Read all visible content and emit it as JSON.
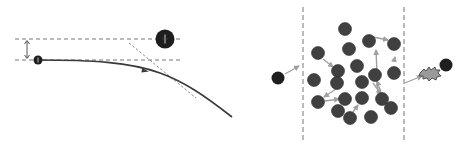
{
  "figure": {
    "colors": {
      "particle_dark": "#1e1e1e",
      "scatterer": "#404040",
      "dashed_line": "#777777",
      "arrow_light": "#a0a0a0",
      "trajectory": "#3a3a3a",
      "burst_fill": "#9a9a9a"
    }
  },
  "left_panel": {
    "name": "single-scattering-deflection",
    "elements": {
      "small_particle": {
        "symbol": "+",
        "role": "incident charged particle"
      },
      "large_particle": {
        "symbol": "+",
        "role": "target nucleus"
      },
      "impact_parameter": "double-headed arrow between parallel dashed lines",
      "trajectory": "curved path bending away from target",
      "asymptote": "dotted tangent line to outgoing trajectory"
    }
  },
  "right_panel": {
    "name": "multiple-scattering-slab",
    "scatterer_count": 20,
    "elements": {
      "incoming_particle": "dark sphere left of slab",
      "slab_boundaries": "two vertical dashed lines",
      "scatterers": "grey spheres with light-grey momentum-transfer arrows",
      "outgoing_particle": "dark sphere right of slab",
      "interaction_burst": "star-shaped burst at exit"
    }
  }
}
